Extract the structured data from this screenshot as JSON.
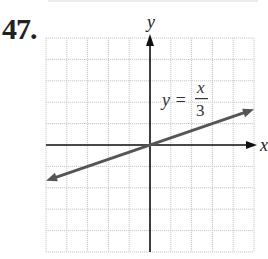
{
  "problem": {
    "number": "47."
  },
  "chart_data": {
    "type": "line",
    "title": "",
    "xlabel": "x",
    "ylabel": "y",
    "equation_label": {
      "lhs": "y =",
      "numerator": "x",
      "denominator": "3"
    },
    "xlim": [
      -5,
      5
    ],
    "ylim": [
      -5,
      5
    ],
    "grid": true,
    "grid_step": 1,
    "series": [
      {
        "name": "y = x/3",
        "x": [
          -5,
          5
        ],
        "y": [
          -1.6667,
          1.6667
        ]
      }
    ],
    "colors": {
      "line": "#555555",
      "axes": "#111111",
      "grid": "#c8c8c8"
    }
  }
}
